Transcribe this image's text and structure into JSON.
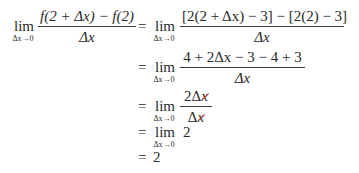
{
  "derivation": {
    "row1": {
      "lim": {
        "word": "lim",
        "sub": "Δx→0"
      },
      "lhs": {
        "num": "f(2 + Δx) − f(2)",
        "den": "Δx"
      },
      "eq": "=",
      "lim2": {
        "word": "lim",
        "sub": "Δx→0"
      },
      "rhs": {
        "num": "[2(2 + Δx) − 3] − [2(2) − 3]",
        "den": "Δx"
      }
    },
    "row2": {
      "eq": "=",
      "lim": {
        "word": "lim",
        "sub": "Δx→0"
      },
      "frac": {
        "num": "4 + 2Δx − 3 − 4 + 3",
        "den": "Δx"
      }
    },
    "row3": {
      "eq": "=",
      "lim": {
        "word": "lim",
        "sub": "Δx→0"
      },
      "frac": {
        "num_coef": "2Δ",
        "num_var": "x",
        "den_coef": "Δ",
        "den_var": "x"
      },
      "cancel_color": "#c0392b"
    },
    "row4": {
      "eq": "=",
      "lim": {
        "word": "lim",
        "sub": "Δx→0"
      },
      "value": "2"
    },
    "row5": {
      "eq": "=",
      "value": "2"
    }
  }
}
